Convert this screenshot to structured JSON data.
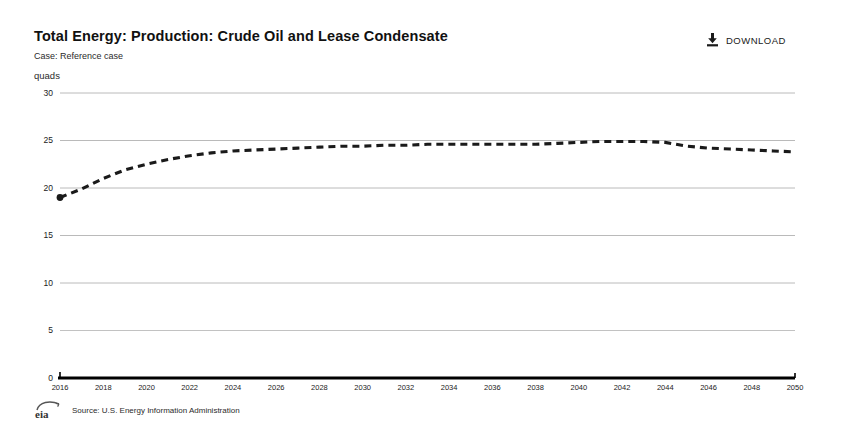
{
  "header": {
    "title": "Total Energy: Production: Crude Oil and Lease Condensate",
    "subtitle": "Case: Reference case",
    "unit_label": "quads"
  },
  "toolbar": {
    "download_label": "DOWNLOAD",
    "download_icon": "download-icon"
  },
  "footer": {
    "logo_text": "eia",
    "source": "Source: U.S. Energy Information Administration"
  },
  "colors": {
    "series": "#1a1a1a",
    "gridline": "#a8a8a8",
    "axis": "#000000",
    "text": "#1a1a1a",
    "background": "#ffffff"
  },
  "chart_data": {
    "type": "line",
    "title": "Total Energy: Production: Crude Oil and Lease Condensate",
    "subtitle": "Case: Reference case",
    "xlabel": "",
    "ylabel": "quads",
    "ylim": [
      0,
      30
    ],
    "xlim": [
      2016,
      2050
    ],
    "yticks": [
      0,
      5,
      10,
      15,
      20,
      25,
      30
    ],
    "xticks": [
      2016,
      2018,
      2020,
      2022,
      2024,
      2026,
      2028,
      2030,
      2032,
      2034,
      2036,
      2038,
      2040,
      2042,
      2044,
      2046,
      2048,
      2050
    ],
    "grid": true,
    "legend": false,
    "line_style": "dashed",
    "x": [
      2016,
      2017,
      2018,
      2019,
      2020,
      2021,
      2022,
      2023,
      2024,
      2025,
      2026,
      2027,
      2028,
      2029,
      2030,
      2031,
      2032,
      2033,
      2034,
      2035,
      2036,
      2037,
      2038,
      2039,
      2040,
      2041,
      2042,
      2043,
      2044,
      2045,
      2046,
      2047,
      2048,
      2049,
      2050
    ],
    "series": [
      {
        "name": "Crude Oil and Lease Condensate",
        "values": [
          19.0,
          19.9,
          21.0,
          21.9,
          22.5,
          23.0,
          23.4,
          23.7,
          23.9,
          24.0,
          24.1,
          24.2,
          24.3,
          24.4,
          24.4,
          24.5,
          24.5,
          24.6,
          24.6,
          24.6,
          24.6,
          24.6,
          24.6,
          24.7,
          24.8,
          24.9,
          24.9,
          24.9,
          24.8,
          24.4,
          24.2,
          24.1,
          24.0,
          23.9,
          23.8
        ]
      }
    ]
  }
}
